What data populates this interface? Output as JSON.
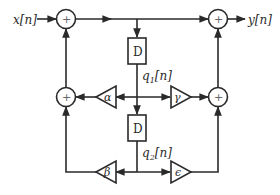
{
  "diagram": {
    "input_label": "x[n]",
    "output_label": "y[n]",
    "adder_symbol": "+",
    "delay_top": {
      "label": "D"
    },
    "delay_bottom": {
      "label": "D"
    },
    "state_q1": {
      "base": "q",
      "sub": "1",
      "arg": "[n]"
    },
    "state_q2": {
      "base": "q",
      "sub": "2",
      "arg": "[n]"
    },
    "gains": {
      "alpha": "α",
      "gamma": "γ",
      "beta": "β",
      "epsilon": "ϵ"
    },
    "colors": {
      "line": "#2a2a2a",
      "background": "#ffffff"
    }
  }
}
